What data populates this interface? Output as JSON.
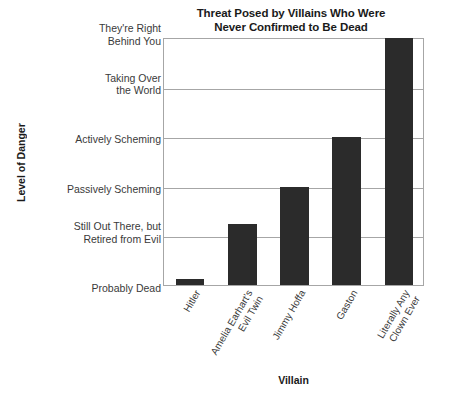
{
  "chart_data": {
    "type": "bar",
    "title": "Threat Posed by Villains Who Were Never Confirmed to Be Dead",
    "title_lines": [
      "Threat Posed by Villains Who Were",
      "Never Confirmed to Be Dead"
    ],
    "xlabel": "Villain",
    "ylabel": "Level of Danger",
    "grid": true,
    "legend": "none",
    "categories": [
      "Hitler",
      "Amelia Earhart's Evil Twin",
      "Jimmy Hoffa",
      "Gaston",
      "Literally Any Clown Ever"
    ],
    "category_lines": [
      [
        "Hitler"
      ],
      [
        "Amelia Earhart's",
        "Evil Twin"
      ],
      [
        "Jimmy Hoffa"
      ],
      [
        "Gaston"
      ],
      [
        "Literally Any",
        "Clown Ever"
      ]
    ],
    "values": [
      0.15,
      1.25,
      2.0,
      3.0,
      5.0
    ],
    "ylim": [
      0,
      5
    ],
    "ytick_values": [
      0,
      1,
      2,
      3,
      4,
      5
    ],
    "ytick_labels": [
      "Probably Dead",
      "Still Out There, but\nRetired from Evil",
      "Passively Scheming",
      "Actively Scheming",
      "Taking Over\nthe World",
      "They're Right\nBehind You"
    ],
    "bar_color": "#2b2b2b",
    "grid_color": "#a6a6a6",
    "text_color": "#3a3a3a"
  }
}
